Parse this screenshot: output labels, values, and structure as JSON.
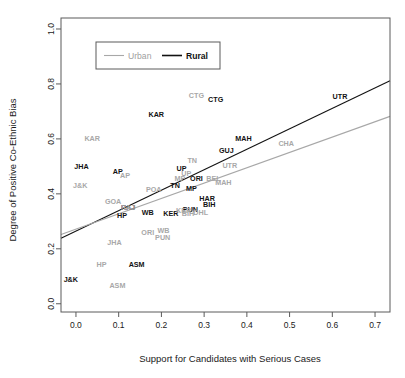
{
  "chart_data": {
    "type": "scatter",
    "title": "",
    "xlabel": "Support for Candidates with Serious Cases",
    "ylabel": "Degree of Positive Co-Ethnic Bias",
    "xlim": [
      -0.035,
      0.735
    ],
    "ylim": [
      -0.03,
      1.04
    ],
    "xticks": [
      0.0,
      0.1,
      0.2,
      0.3,
      0.4,
      0.5,
      0.6,
      0.7
    ],
    "xticklabels": [
      "0.0",
      "0.1",
      "0.2",
      "0.3",
      "0.4",
      "0.5",
      "0.6",
      "0.7"
    ],
    "yticks": [
      0.0,
      0.2,
      0.4,
      0.6,
      0.8,
      1.0
    ],
    "yticklabels": [
      "0.0",
      "0.2",
      "0.4",
      "0.6",
      "0.8",
      "1.0"
    ],
    "grid": false,
    "legend_position": "top-left",
    "colors": {
      "rural": "#121212",
      "urban": "#a8a8a8",
      "frame": "#5a5a5a",
      "background": "#ffffff"
    },
    "legend": [
      {
        "name": "Urban",
        "color": "#a8a8a8"
      },
      {
        "name": "Rural",
        "color": "#121212"
      }
    ],
    "series": [
      {
        "name": "Rural",
        "color": "#121212",
        "marker": "text-label",
        "points": [
          {
            "label": "UTR",
            "x": 0.618,
            "y": 0.755
          },
          {
            "label": "CTG",
            "x": 0.327,
            "y": 0.745
          },
          {
            "label": "KAR",
            "x": 0.188,
            "y": 0.69
          },
          {
            "label": "MAH",
            "x": 0.392,
            "y": 0.6
          },
          {
            "label": "GUJ",
            "x": 0.352,
            "y": 0.558
          },
          {
            "label": "JHA",
            "x": 0.013,
            "y": 0.5
          },
          {
            "label": "UP",
            "x": 0.247,
            "y": 0.492
          },
          {
            "label": "AP",
            "x": 0.098,
            "y": 0.483
          },
          {
            "label": "ORI",
            "x": 0.282,
            "y": 0.455
          },
          {
            "label": "TN",
            "x": 0.232,
            "y": 0.432
          },
          {
            "label": "MP",
            "x": 0.27,
            "y": 0.42
          },
          {
            "label": "HAR",
            "x": 0.307,
            "y": 0.382
          },
          {
            "label": "BIH",
            "x": 0.312,
            "y": 0.362
          },
          {
            "label": "RAJ",
            "x": 0.122,
            "y": 0.352
          },
          {
            "label": "PUN",
            "x": 0.268,
            "y": 0.345
          },
          {
            "label": "KER",
            "x": 0.222,
            "y": 0.33
          },
          {
            "label": "WB",
            "x": 0.168,
            "y": 0.332
          },
          {
            "label": "HP",
            "x": 0.108,
            "y": 0.32
          },
          {
            "label": "ASM",
            "x": 0.142,
            "y": 0.142
          },
          {
            "label": "J&K",
            "x": -0.012,
            "y": 0.088
          }
        ]
      },
      {
        "name": "Urban",
        "color": "#a8a8a8",
        "marker": "text-label",
        "points": [
          {
            "label": "CTG",
            "x": 0.282,
            "y": 0.758
          },
          {
            "label": "CHA",
            "x": 0.492,
            "y": 0.585
          },
          {
            "label": "KAR",
            "x": 0.038,
            "y": 0.6
          },
          {
            "label": "TN",
            "x": 0.272,
            "y": 0.522
          },
          {
            "label": "UTR",
            "x": 0.36,
            "y": 0.505
          },
          {
            "label": "UP",
            "x": 0.258,
            "y": 0.475
          },
          {
            "label": "AP",
            "x": 0.115,
            "y": 0.468
          },
          {
            "label": "MP",
            "x": 0.243,
            "y": 0.458
          },
          {
            "label": "BEL",
            "x": 0.322,
            "y": 0.455
          },
          {
            "label": "MAH",
            "x": 0.345,
            "y": 0.44
          },
          {
            "label": "J&K",
            "x": 0.01,
            "y": 0.432
          },
          {
            "label": "POA",
            "x": 0.182,
            "y": 0.418
          },
          {
            "label": "GOA",
            "x": 0.087,
            "y": 0.372
          },
          {
            "label": "RAJ",
            "x": 0.122,
            "y": 0.352
          },
          {
            "label": "KER",
            "x": 0.252,
            "y": 0.34
          },
          {
            "label": "BIH",
            "x": 0.262,
            "y": 0.33
          },
          {
            "label": "DHL",
            "x": 0.292,
            "y": 0.332
          },
          {
            "label": "WB",
            "x": 0.205,
            "y": 0.268
          },
          {
            "label": "ORI",
            "x": 0.168,
            "y": 0.258
          },
          {
            "label": "PUN",
            "x": 0.203,
            "y": 0.24
          },
          {
            "label": "JHA",
            "x": 0.09,
            "y": 0.222
          },
          {
            "label": "HP",
            "x": 0.06,
            "y": 0.142
          },
          {
            "label": "ASM",
            "x": 0.097,
            "y": 0.068
          }
        ]
      }
    ],
    "fit_lines": [
      {
        "name": "Rural",
        "color": "#121212",
        "x_start": -0.035,
        "y_start": 0.238,
        "x_end": 0.735,
        "y_end": 0.812
      },
      {
        "name": "Urban",
        "color": "#a8a8a8",
        "x_start": -0.035,
        "y_start": 0.252,
        "x_end": 0.735,
        "y_end": 0.682
      }
    ]
  }
}
